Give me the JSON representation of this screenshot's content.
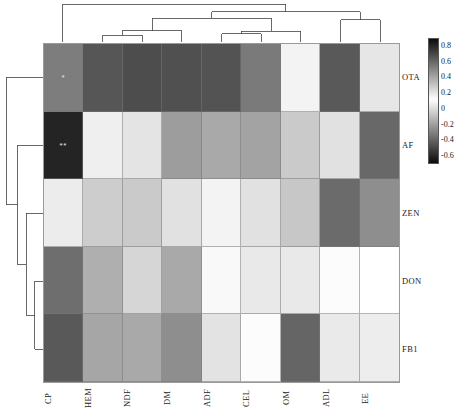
{
  "chart_data": {
    "type": "heatmap",
    "title": "",
    "xlabel": "",
    "ylabel": "",
    "columns": [
      "CP",
      "HEM",
      "NDF",
      "DM",
      "ADF",
      "CEL",
      "OM",
      "ADL",
      "EE"
    ],
    "rows": [
      "OTA",
      "AF",
      "ZEN",
      "DON",
      "FB1"
    ],
    "values": [
      [
        -0.32,
        -0.45,
        -0.48,
        -0.47,
        -0.46,
        -0.33,
        0.16,
        -0.44,
        0.2
      ],
      [
        -0.62,
        0.17,
        0.03,
        -0.21,
        -0.17,
        -0.19,
        -0.06,
        0.02,
        -0.39
      ],
      [
        0.18,
        -0.05,
        -0.06,
        0.02,
        0.16,
        0.02,
        -0.07,
        -0.38,
        -0.26
      ],
      [
        -0.37,
        -0.15,
        -0.02,
        -0.17,
        0.1,
        0.19,
        0.19,
        0.13,
        0.12
      ],
      [
        -0.44,
        -0.18,
        -0.17,
        -0.26,
        0.21,
        0.11,
        -0.4,
        0.05,
        0.06
      ]
    ],
    "significance": [
      [
        "*",
        "",
        "",
        "",
        "",
        "",
        "",
        "",
        ""
      ],
      [
        "**",
        "",
        "",
        "",
        "",
        "",
        "",
        "",
        ""
      ],
      [
        "",
        "",
        "",
        "",
        "",
        "",
        "",
        "",
        ""
      ],
      [
        "",
        "",
        "",
        "",
        "",
        "",
        "",
        "",
        ""
      ],
      [
        "",
        "",
        "",
        "",
        "",
        "",
        "",
        "",
        ""
      ]
    ],
    "colorbar": {
      "ticks": [
        0.8,
        0.6,
        0.4,
        0.2,
        0,
        -0.2,
        -0.4,
        -0.6
      ],
      "tick_labels": [
        "0.8",
        "0.6",
        "0.4",
        "0.2",
        "0",
        "-0.2",
        "-0.4",
        "-0.6"
      ],
      "vmax": 0.9,
      "vmin": -0.7,
      "midpoint": 0.12,
      "scheme": "diverging-grayscale"
    },
    "grid": false,
    "legend_position": "right",
    "row_dendrogram": {
      "position": "left",
      "leaf_order": [
        "OTA",
        "AF",
        "ZEN",
        "DON",
        "FB1"
      ],
      "links": [
        {
          "merge": [
            "DON",
            "FB1"
          ],
          "height": 0.22
        },
        {
          "merge": [
            "ZEN",
            "DON+FB1"
          ],
          "height": 0.45
        },
        {
          "merge": [
            "AF",
            "ZEN+DON+FB1"
          ],
          "height": 0.7
        },
        {
          "merge": [
            "OTA",
            "rest"
          ],
          "height": 1.0
        }
      ]
    },
    "col_dendrogram": {
      "position": "top",
      "leaf_order": [
        "CP",
        "HEM",
        "NDF",
        "DM",
        "ADF",
        "CEL",
        "OM",
        "ADL",
        "EE"
      ],
      "links": [
        {
          "merge": [
            "HEM",
            "NDF"
          ],
          "height": 0.18
        },
        {
          "merge": [
            "HEM+NDF",
            "DM"
          ],
          "height": 0.3
        },
        {
          "merge": [
            "ADF",
            "CEL"
          ],
          "height": 0.22
        },
        {
          "merge": [
            "ADF+CEL",
            "OM"
          ],
          "height": 0.28
        },
        {
          "merge": [
            "HEM+NDF+DM",
            "ADF+CEL+OM"
          ],
          "height": 0.62
        },
        {
          "merge": [
            "ADL",
            "EE"
          ],
          "height": 0.58
        },
        {
          "merge": [
            "left-cluster",
            "ADL+EE"
          ],
          "height": 0.8
        },
        {
          "merge": [
            "CP",
            "all"
          ],
          "height": 1.0
        }
      ]
    }
  },
  "footer": {
    "note": ""
  }
}
